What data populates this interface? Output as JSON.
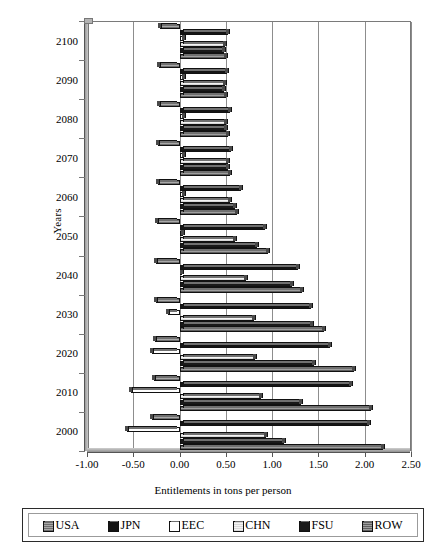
{
  "chart_data": {
    "type": "bar",
    "orientation": "horizontal",
    "title": "",
    "xlabel": "Entitlements in tons per person",
    "ylabel": "Years",
    "xlim": [
      -1.0,
      2.5
    ],
    "xticks": [
      "-1.00",
      "-0.50",
      "0.00",
      "0.50",
      "1.00",
      "1.50",
      "2.00",
      "2.50"
    ],
    "xtick_values": [
      -1.0,
      -0.5,
      0.0,
      0.5,
      1.0,
      1.5,
      2.0,
      2.5
    ],
    "grid": true,
    "legend_position": "bottom",
    "categories": [
      "2000",
      "2010",
      "2020",
      "2030",
      "2040",
      "2050",
      "2060",
      "2070",
      "2080",
      "2090",
      "2100"
    ],
    "series": [
      {
        "name": "USA",
        "color": "#8a8a8a",
        "values": [
          -0.3,
          -0.28,
          -0.27,
          -0.25,
          -0.25,
          -0.24,
          -0.23,
          -0.23,
          -0.22,
          -0.22,
          -0.21
        ]
      },
      {
        "name": "JPN",
        "color": "#141414",
        "values": [
          2.05,
          1.85,
          1.62,
          1.42,
          1.28,
          0.92,
          0.66,
          0.56,
          0.54,
          0.51,
          0.52
        ]
      },
      {
        "name": "EEC",
        "color": "#ffffff",
        "values": [
          -0.57,
          -0.52,
          -0.3,
          -0.12,
          0.02,
          0.04,
          0.05,
          0.05,
          0.05,
          0.05,
          0.05
        ]
      },
      {
        "name": "CHN",
        "color": "#ededed",
        "values": [
          0.93,
          0.88,
          0.82,
          0.8,
          0.72,
          0.6,
          0.55,
          0.52,
          0.5,
          0.49,
          0.49
        ]
      },
      {
        "name": "FSU",
        "color": "#191919",
        "values": [
          1.13,
          1.31,
          1.45,
          1.43,
          1.22,
          0.84,
          0.6,
          0.52,
          0.5,
          0.48,
          0.48
        ]
      },
      {
        "name": "ROW",
        "color": "#7c7c7c",
        "values": [
          2.2,
          2.07,
          1.88,
          1.56,
          1.32,
          0.95,
          0.62,
          0.54,
          0.52,
          0.5,
          0.5
        ]
      }
    ]
  },
  "legend": {
    "items": [
      {
        "label": "USA"
      },
      {
        "label": "JPN"
      },
      {
        "label": "EEC"
      },
      {
        "label": "CHN"
      },
      {
        "label": "FSU"
      },
      {
        "label": "ROW"
      }
    ]
  }
}
